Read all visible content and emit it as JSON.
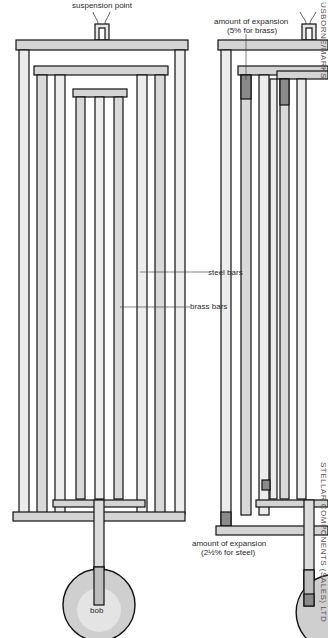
{
  "diagram": {
    "left_figure": {
      "labels": {
        "suspension_point": "suspension point",
        "steel_bars": "steel bars",
        "brass_bars": "brass bars",
        "bob": "bob"
      }
    },
    "right_figure": {
      "labels": {
        "brass_expansion_line1": "amount of expansion",
        "brass_expansion_line2": "(5% for brass)",
        "steel_expansion_line1": "amount of expansion",
        "steel_expansion_line2": "(2½% for steel)"
      }
    },
    "credits": {
      "top_right": "USBORNE/MARKS",
      "right_side": "STELLAR COMPONENTS (SALES) LTD"
    },
    "colors": {
      "bar_fill": "#d9d9d9",
      "bar_light": "#ececec",
      "outline": "#111111",
      "expansion": "#8a8a8a",
      "bob_outer": "#cfcfcf",
      "bob_inner": "#e4e4e4"
    }
  }
}
